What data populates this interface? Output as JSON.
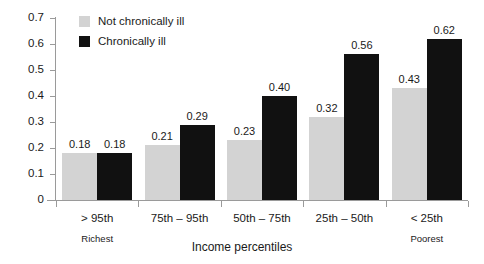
{
  "chart_data": {
    "type": "bar",
    "title": "",
    "xlabel": "Income percentiles",
    "ylabel": "",
    "ylim": [
      0,
      0.7
    ],
    "ytick_labels": [
      "0",
      "0.1",
      "0.2",
      "0.3",
      "0.4",
      "0.5",
      "0.6",
      "0.7"
    ],
    "ytick_values": [
      0,
      0.1,
      0.2,
      0.3,
      0.4,
      0.5,
      0.6,
      0.7
    ],
    "grid": false,
    "legend_position": "top-left inside",
    "categories": [
      "> 95th",
      "75th – 95th",
      "50th – 75th",
      "25th – 50th",
      "< 25th"
    ],
    "category_sublabels": [
      "Richest",
      "",
      "",
      "",
      "Poorest"
    ],
    "series": [
      {
        "name": "Not chronically ill",
        "color": "#d3d3d3",
        "values": [
          0.18,
          0.21,
          0.23,
          0.32,
          0.43
        ],
        "value_labels": [
          "0.18",
          "0.21",
          "0.23",
          "0.32",
          "0.43"
        ]
      },
      {
        "name": "Chronically ill",
        "color": "#111111",
        "values": [
          0.18,
          0.29,
          0.4,
          0.56,
          0.62
        ],
        "value_labels": [
          "0.18",
          "0.29",
          "0.40",
          "0.56",
          "0.62"
        ]
      }
    ]
  },
  "colors": {
    "axis": "#9a9a9a",
    "text": "#1a1a1a",
    "background": "#ffffff",
    "series_light": "#d3d3d3",
    "series_dark": "#111111"
  }
}
